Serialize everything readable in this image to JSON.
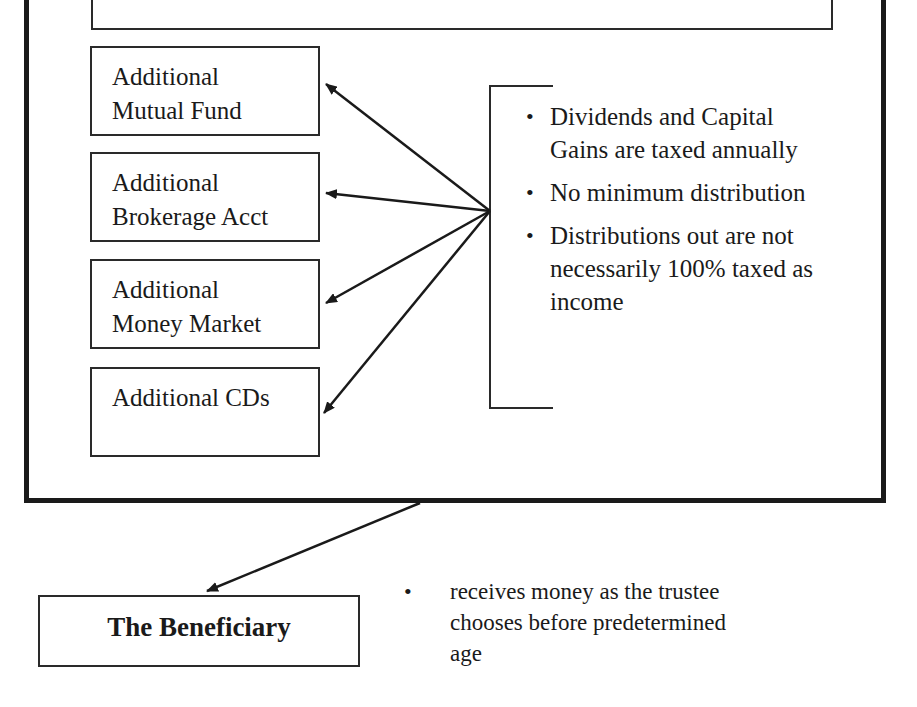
{
  "diagram": {
    "accounts": [
      {
        "line1": "Additional",
        "line2": "Mutual Fund"
      },
      {
        "line1": "Additional",
        "line2": "Brokerage Acct"
      },
      {
        "line1": "Additional",
        "line2": "Money Market"
      },
      {
        "line1": "Additional CDs",
        "line2": ""
      }
    ],
    "bullets": [
      "Dividends and Capital Gains are taxed annually",
      "No minimum distribution",
      "Distributions out are not necessarily 100% taxed as income"
    ],
    "beneficiary": {
      "label": "The Beneficiary",
      "note": "receives money as the trustee chooses before predetermined age"
    },
    "bullet_glyph": "•",
    "colors": {
      "line": "#1a1a1a",
      "background": "#ffffff"
    }
  }
}
